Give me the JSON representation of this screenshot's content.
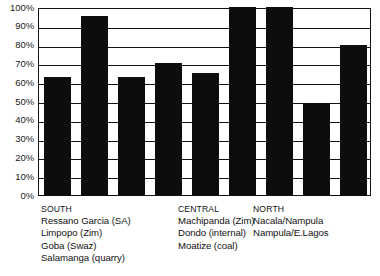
{
  "chart_data": {
    "type": "bar",
    "title": "",
    "subtitle": "",
    "xlabel": "",
    "ylabel": "",
    "ylim": [
      0,
      100
    ],
    "grid": true,
    "legend_position": "below-axis",
    "yticks": [
      "100%",
      "90%",
      "80%",
      "70%",
      "60%",
      "50%",
      "40%",
      "30%",
      "20%",
      "10%",
      "0%"
    ],
    "ytick_values": [
      100,
      90,
      80,
      70,
      60,
      50,
      40,
      30,
      20,
      10,
      0
    ],
    "categories": [
      "Ressano Garcia (SA)",
      "Limpopo (Zim)",
      "Goba (Swaz)",
      "Salamanga (quarry)",
      "Machipanda (Zim)",
      "Dondo (internal)",
      "Moatize (coal)",
      "Nacala/Nampula",
      "Nampula/E.Lagos"
    ],
    "values": [
      63,
      95,
      63,
      70,
      65,
      100,
      100,
      49,
      80
    ],
    "bar_color": "#0d0d0d",
    "groups": [
      {
        "title": "SOUTH",
        "items": [
          "Ressano Garcia (SA)",
          "Limpopo (Zim)",
          "Goba (Swaz)",
          "Salamanga (quarry)"
        ]
      },
      {
        "title": "CENTRAL",
        "items": [
          "Machipanda (Zim)",
          "Dondo (internal)",
          "Moatize (coal)"
        ]
      },
      {
        "title": "NORTH",
        "items": [
          "Nacala/Nampula",
          "Nampula/E.Lagos"
        ]
      }
    ]
  },
  "colors": {
    "bar": "#0d0d0d",
    "axis": "#111111",
    "background": "#ffffff",
    "text": "#111111"
  }
}
